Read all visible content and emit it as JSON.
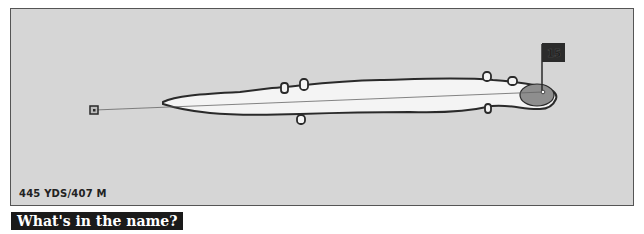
{
  "hole": {
    "number": "15",
    "yardage_label": "445 YDS/407 M"
  },
  "section": {
    "heading": "What's in the name?"
  },
  "icons": {
    "tee": "tee-marker-icon",
    "flag": "flag-icon",
    "green": "green-icon",
    "bunker": "bunker-icon"
  },
  "colors": {
    "background": "#d6d6d6",
    "fairway": "#f4f4f4",
    "outline": "#2a2a2a",
    "green": "#8e8e8e",
    "flag": "#2b2b2b",
    "banner": "#1a1a1a"
  }
}
